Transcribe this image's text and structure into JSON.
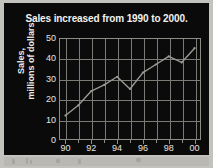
{
  "figure": {
    "background_color": "#c3c2bd",
    "plate_color": "#0a0a0a",
    "title": "Sales increased from 1990 to 2000."
  },
  "chart_data": {
    "type": "line",
    "title": "Sales increased from 1990 to 2000.",
    "xlabel": "",
    "ylabel": "Sales, millions of dollars",
    "ylabel_line1": "Sales,",
    "ylabel_line2": "millions of dollars",
    "x": [
      1990,
      1991,
      1992,
      1993,
      1994,
      1995,
      1996,
      1997,
      1998,
      1999,
      2000
    ],
    "values": [
      12,
      17,
      24,
      27,
      31,
      25,
      33,
      37,
      41,
      38,
      45
    ],
    "x_tick_labels": [
      "90",
      "92",
      "94",
      "96",
      "98",
      "00"
    ],
    "x_tick_values": [
      1990,
      1992,
      1994,
      1996,
      1998,
      2000
    ],
    "y_tick_labels": [
      "0",
      "10",
      "20",
      "30",
      "40",
      "50"
    ],
    "y_tick_values": [
      0,
      10,
      20,
      30,
      40,
      50
    ],
    "xlim": [
      1989.5,
      2000.5
    ],
    "ylim": [
      0,
      50
    ],
    "grid": true,
    "legend": false,
    "line_color": "#9a9a95",
    "grid_color": "#7b7b76",
    "axis_color": "#8d8d88",
    "text_color": "#e6e6e1"
  }
}
